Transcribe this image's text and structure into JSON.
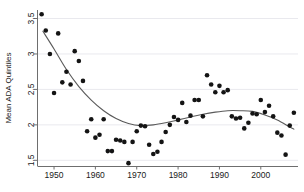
{
  "figure": {
    "background": "#ffffff",
    "point_color": "#141414",
    "curve_color": "#5a5a5a",
    "axis_color": "#6e6e6e",
    "grid_color": "#e9e9ee"
  },
  "chart_data": {
    "type": "scatter",
    "title": "",
    "xlabel": "",
    "ylabel": "Mean ADA Quintiles",
    "xlim": [
      1946,
      2009
    ],
    "ylim": [
      1.42,
      3.62
    ],
    "grid": true,
    "legend": "none",
    "xticks": [
      1950,
      1960,
      1970,
      1980,
      1990,
      2000
    ],
    "xticklabels": [
      "1950",
      "1960",
      "1970",
      "1980",
      "1990",
      "2000"
    ],
    "yticks": [
      1.5,
      2,
      2.5,
      3,
      3.5
    ],
    "yticklabels": [
      "1.5",
      "2",
      "2.5",
      "3",
      "3.5"
    ],
    "series": [
      {
        "name": "Mean ADA Quintiles",
        "marker": "circle",
        "x": [
          1947,
          1948,
          1949,
          1950,
          1951,
          1952,
          1953,
          1954,
          1955,
          1956,
          1957,
          1958,
          1959,
          1960,
          1961,
          1962,
          1963,
          1964,
          1965,
          1966,
          1967,
          1968,
          1969,
          1970,
          1971,
          1972,
          1973,
          1974,
          1975,
          1976,
          1977,
          1978,
          1979,
          1980,
          1981,
          1982,
          1983,
          1984,
          1985,
          1986,
          1987,
          1988,
          1989,
          1990,
          1991,
          1992,
          1993,
          1994,
          1995,
          1996,
          1997,
          1998,
          1999,
          2000,
          2001,
          2002,
          2003,
          2004,
          2005,
          2006,
          2007,
          2008
        ],
        "y": [
          3.56,
          3.33,
          3.0,
          2.45,
          3.29,
          2.6,
          2.75,
          2.57,
          3.04,
          2.9,
          2.62,
          1.91,
          2.08,
          1.82,
          1.86,
          2.08,
          1.63,
          1.63,
          1.79,
          1.78,
          1.76,
          1.46,
          1.76,
          1.91,
          1.99,
          1.98,
          1.72,
          1.59,
          1.62,
          1.76,
          1.9,
          2.0,
          2.11,
          2.07,
          2.31,
          2.04,
          2.13,
          2.35,
          2.35,
          2.12,
          2.7,
          2.57,
          2.46,
          2.55,
          2.46,
          2.49,
          2.12,
          2.09,
          2.1,
          1.95,
          2.03,
          2.16,
          2.15,
          2.35,
          2.18,
          2.27,
          2.12,
          1.89,
          1.85,
          1.58,
          1.99,
          2.17
        ]
      }
    ],
    "fit_curve": {
      "name": "smoothed-trend",
      "x": [
        1947.3,
        1950,
        1953,
        1956,
        1959,
        1962,
        1965,
        1968,
        1971,
        1974,
        1977,
        1980,
        1983,
        1986,
        1989,
        1992,
        1995,
        1998,
        2001,
        2004,
        2007,
        2008
      ],
      "y": [
        3.32,
        3.07,
        2.78,
        2.54,
        2.35,
        2.2,
        2.09,
        2.02,
        1.99,
        2.0,
        2.03,
        2.07,
        2.11,
        2.15,
        2.18,
        2.2,
        2.2,
        2.19,
        2.14,
        2.07,
        1.97,
        1.94
      ]
    }
  }
}
